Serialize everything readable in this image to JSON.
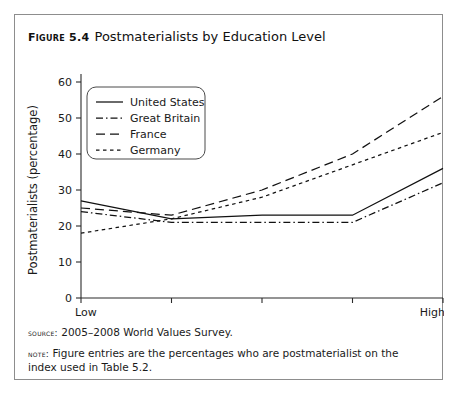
{
  "figure": {
    "label": "Figure 5.4",
    "caption": "Postmaterialists by Education Level",
    "source_key": "Source:",
    "source_text": "2005–2008 World Values Survey.",
    "note_key": "Note:",
    "note_text": "Figure entries are the percentages who are postmaterialist on the index used in Table 5.2."
  },
  "chart_data": {
    "type": "line",
    "title": "Postmaterialists by Education Level",
    "xlabel": "Education level",
    "ylabel": "Postmaterialists (percentage)",
    "categories": [
      "Low",
      "",
      "",
      "",
      "High"
    ],
    "xtick_labels": [
      "Low",
      "High"
    ],
    "ytick_labels": [
      "0",
      "10",
      "20",
      "30",
      "40",
      "50",
      "60"
    ],
    "yticks": [
      0,
      10,
      20,
      30,
      40,
      50,
      60
    ],
    "ylim": [
      0,
      60
    ],
    "xlim": [
      0,
      4
    ],
    "grid": false,
    "legend_position": "upper-left",
    "series": [
      {
        "name": "United States",
        "dash": "solid",
        "values": [
          27,
          22,
          23,
          23,
          36
        ]
      },
      {
        "name": "Great Britain",
        "dash": "dash-dot",
        "values": [
          24,
          21,
          21,
          21,
          32
        ]
      },
      {
        "name": "France",
        "dash": "long-dash",
        "values": [
          25,
          23,
          30,
          40,
          56
        ]
      },
      {
        "name": "Germany",
        "dash": "short-dash",
        "values": [
          18,
          22,
          28,
          37,
          46
        ]
      }
    ]
  }
}
